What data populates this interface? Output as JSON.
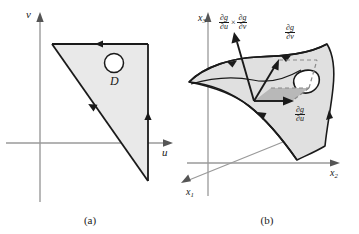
{
  "figure": {
    "panels": [
      {
        "id": "a",
        "caption": "(a)",
        "axes": {
          "horizontal_label": "u",
          "vertical_label": "v"
        },
        "region_label": "D",
        "region_description": "shaded right triangle with circular hole",
        "boundary_orientation": "counterclockwise",
        "colors": {
          "region_fill": "#e9e9e9",
          "region_stroke": "#1a1a1a",
          "axis": "#9a9a9a",
          "hole_fill": "#ffffff"
        }
      },
      {
        "id": "b",
        "caption": "(b)",
        "axes": {
          "x1_label": "x",
          "x1_sub": "1",
          "x2_label": "x",
          "x2_sub": "2",
          "x3_label": "x",
          "x3_sub": "3"
        },
        "vectors": [
          {
            "name": "cross-product-normal",
            "numerator_1": "∂g",
            "denominator_1": "∂u",
            "operator": "×",
            "numerator_2": "∂g",
            "denominator_2": "∂v"
          },
          {
            "name": "partial-v",
            "numerator": "∂g",
            "denominator": "∂v"
          },
          {
            "name": "partial-u",
            "numerator": "∂g",
            "denominator": "∂u"
          }
        ],
        "surface_description": "curved shaded surface with irregular hole",
        "colors": {
          "surface_fill": "#e0e0e0",
          "surface_stroke": "#1a1a1a",
          "parallelogram_fill": "#b8b8b8",
          "axis": "#9a9a9a",
          "hole_fill": "#ffffff",
          "dashed": "#8a8a8a"
        }
      }
    ]
  }
}
